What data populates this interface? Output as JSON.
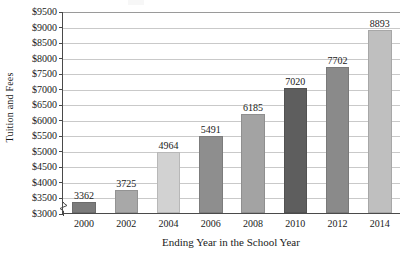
{
  "chart_data": {
    "type": "bar",
    "title": "",
    "xlabel": "Ending Year in the School Year",
    "ylabel": "Tuition and Fees",
    "categories": [
      "2000",
      "2002",
      "2004",
      "2006",
      "2008",
      "2010",
      "2012",
      "2014"
    ],
    "values": [
      3362,
      3725,
      4964,
      5491,
      6185,
      7020,
      7702,
      8893
    ],
    "value_labels": [
      "3362",
      "3725",
      "4964",
      "5491",
      "6185",
      "7020",
      "7702",
      "8893"
    ],
    "ylim": [
      3000,
      9500
    ],
    "ytick_step": 500,
    "y_axis_broken": true,
    "ytick_labels": [
      "$3000",
      "$3500",
      "$4000",
      "$4500",
      "$5000",
      "$5500",
      "$6000",
      "$6500",
      "$7000",
      "$7500",
      "$8000",
      "$8500",
      "$9000",
      "$9500"
    ],
    "ytick_values": [
      3000,
      3500,
      4000,
      4500,
      5000,
      5500,
      6000,
      6500,
      7000,
      7500,
      8000,
      8500,
      9000,
      9500
    ],
    "grid": true,
    "legend": "none",
    "bar_colors": [
      "#7b7b7b",
      "#a8a8a8",
      "#d2d2d2",
      "#8e8e8e",
      "#a3a3a3",
      "#5e5e5e",
      "#8a8a8a",
      "#bfbfbf"
    ],
    "axis_color": "#4a4a4a",
    "grid_color": "#c9c9c9",
    "text_color": "#1a1a1a"
  }
}
